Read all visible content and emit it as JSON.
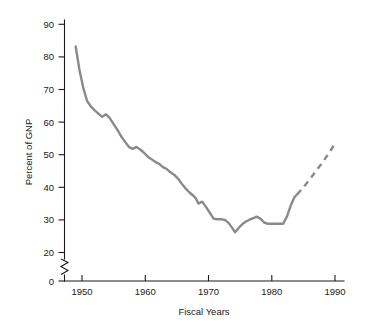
{
  "chart_data": {
    "type": "line",
    "title": "",
    "xlabel": "Fiscal Years",
    "ylabel": "Percent of GNP",
    "xlim": [
      1947,
      1991.5
    ],
    "ylim": [
      0,
      93
    ],
    "grid": false,
    "legend": null,
    "axis_break": {
      "axis": "y",
      "from": 0,
      "to": 20,
      "style": "zigzag"
    },
    "xticks": [
      1950,
      1960,
      1970,
      1980,
      1990
    ],
    "xtick_labels": [
      "1950",
      "1960",
      "1970",
      "1980",
      "1990"
    ],
    "yticks": [
      0,
      20,
      30,
      40,
      50,
      60,
      70,
      80,
      90
    ],
    "ytick_labels": [
      "0",
      "20",
      "30",
      "40",
      "50",
      "60",
      "70",
      "80",
      "90"
    ],
    "line_color": "#8a8a8a",
    "series": [
      {
        "name": "Percent of GNP",
        "style": "solid",
        "x": [
          1949.0,
          1949.6,
          1950.2,
          1950.8,
          1951.4,
          1952.0,
          1952.6,
          1953.2,
          1953.8,
          1954.4,
          1955.0,
          1955.6,
          1956.2,
          1956.8,
          1957.4,
          1958.0,
          1958.6,
          1959.2,
          1959.8,
          1960.4,
          1961.0,
          1961.6,
          1962.2,
          1962.8,
          1963.4,
          1964.0,
          1964.6,
          1965.2,
          1965.8,
          1966.4,
          1967.0,
          1967.6,
          1968.0,
          1968.4,
          1969.0,
          1969.6,
          1970.2,
          1970.8,
          1971.4,
          1972.0,
          1972.6,
          1973.2,
          1973.8,
          1974.2,
          1974.8,
          1975.4,
          1976.0,
          1976.6,
          1977.2,
          1977.6,
          1978.2,
          1978.8,
          1979.4,
          1980.0,
          1980.6,
          1981.2,
          1981.8,
          1982.4,
          1983.0,
          1983.6,
          1984.0
        ],
        "y": [
          83.2,
          76.0,
          70.5,
          66.5,
          64.8,
          63.6,
          62.6,
          61.6,
          62.4,
          61.2,
          59.4,
          57.6,
          55.6,
          54.0,
          52.4,
          51.8,
          52.4,
          51.6,
          50.6,
          49.4,
          48.6,
          47.8,
          47.2,
          46.2,
          45.6,
          44.6,
          43.8,
          42.6,
          41.0,
          39.6,
          38.4,
          37.4,
          36.6,
          35.0,
          35.6,
          34.0,
          32.2,
          30.4,
          30.2,
          30.2,
          30.0,
          29.0,
          27.4,
          26.2,
          27.6,
          28.8,
          29.6,
          30.2,
          30.6,
          31.0,
          30.4,
          29.2,
          28.8,
          28.8,
          28.8,
          28.8,
          28.8,
          31.0,
          34.4,
          37.0,
          37.8
        ]
      },
      {
        "name": "Percent of GNP (projected)",
        "style": "dashed",
        "x": [
          1984.0,
          1985.0,
          1986.0,
          1987.0,
          1988.0,
          1989.0,
          1989.8
        ],
        "y": [
          37.8,
          40.0,
          42.4,
          45.0,
          47.6,
          50.4,
          52.8
        ]
      }
    ]
  }
}
